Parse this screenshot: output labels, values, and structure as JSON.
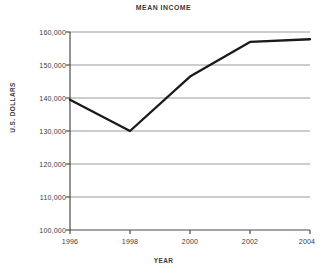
{
  "chart_data": {
    "type": "line",
    "title": "MEAN INCOME",
    "xlabel": "YEAR",
    "ylabel": "U.S. DOLLARS",
    "x": [
      1996,
      1998,
      2000,
      2002,
      2004
    ],
    "values": [
      139500,
      130000,
      146500,
      157000,
      157800
    ],
    "series": [
      {
        "name": "Mean income",
        "values": [
          139500,
          130000,
          146500,
          157000,
          157800
        ]
      }
    ],
    "x_tick_labels": [
      "1996",
      "1998",
      "2000",
      "2002",
      "2004"
    ],
    "y_tick_labels": [
      "100,000",
      "110,000",
      "120,000",
      "130,000",
      "140,000",
      "150,000",
      "160,000"
    ],
    "y_tick_values": [
      100000,
      110000,
      120000,
      130000,
      140000,
      150000,
      160000
    ],
    "xlim": [
      1996,
      2004
    ],
    "ylim": [
      100000,
      160000
    ],
    "grid": "horizontal",
    "legend": "none",
    "line_color": "#1a1a1a",
    "grid_color": "#9a9a9a",
    "axis_color": "#4a4a4a",
    "background_color": "#ffffff"
  }
}
